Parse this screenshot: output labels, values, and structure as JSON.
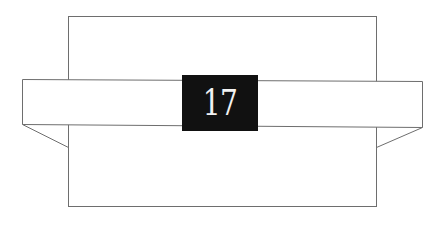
{
  "diagram": {
    "label": "17",
    "colors": {
      "stroke": "#6e6e6e",
      "label_bg": "#111111",
      "label_text": "#f2f2f2",
      "background": "#ffffff"
    }
  }
}
